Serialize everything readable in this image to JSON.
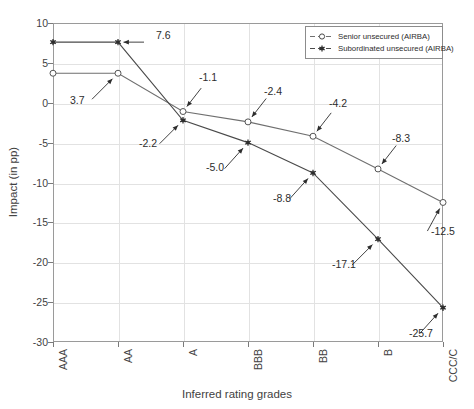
{
  "chart_data": {
    "type": "line",
    "title": "",
    "xlabel": "Inferred rating grades",
    "ylabel": "Impact (in pp)",
    "categories": [
      "AAA",
      "AA",
      "A",
      "BBB",
      "BB",
      "B",
      "CCC/C"
    ],
    "ylim": [
      -30,
      10
    ],
    "yticks": [
      10,
      5,
      0,
      -5,
      -10,
      -15,
      -20,
      -25,
      -30
    ],
    "ytick_labels": [
      "10",
      "5",
      "0",
      "-5",
      "-10",
      "-15",
      "-20",
      "-25",
      "-30"
    ],
    "grid": true,
    "legend_position": "top-right",
    "series": [
      {
        "name": "Senior unsecured (AIRBA)",
        "marker": "open-circle",
        "color": "#6f6f6f",
        "values": [
          3.7,
          3.7,
          -1.1,
          -2.4,
          -4.2,
          -8.3,
          -12.5
        ],
        "labels": [
          "3.7",
          "3.7",
          "-1.1",
          "-2.4",
          "-4.2",
          "-8.3",
          "-12.5"
        ]
      },
      {
        "name": "Subordinated unsecured (AIRBA)",
        "marker": "filled-star",
        "color": "#4a4a4a",
        "values": [
          7.6,
          7.6,
          -2.2,
          -5.0,
          -8.8,
          -17.1,
          -25.7
        ],
        "labels": [
          "7.6",
          "7.6",
          "-2.2",
          "-5.0",
          "-8.8",
          "-17.1",
          "-25.7"
        ]
      }
    ],
    "annotations": [
      {
        "text": "7.6",
        "series": "Subordinated unsecured (AIRBA)",
        "category": "AA",
        "value": 7.6
      },
      {
        "text": "3.7",
        "series": "Senior unsecured (AIRBA)",
        "category": "AA",
        "value": 3.7
      },
      {
        "text": "-1.1",
        "series": "Senior unsecured (AIRBA)",
        "category": "A",
        "value": -1.1
      },
      {
        "text": "-2.2",
        "series": "Subordinated unsecured (AIRBA)",
        "category": "A",
        "value": -2.2
      },
      {
        "text": "-2.4",
        "series": "Senior unsecured (AIRBA)",
        "category": "BBB",
        "value": -2.4
      },
      {
        "text": "-5.0",
        "series": "Subordinated unsecured (AIRBA)",
        "category": "BBB",
        "value": -5.0
      },
      {
        "text": "-4.2",
        "series": "Senior unsecured (AIRBA)",
        "category": "BB",
        "value": -4.2
      },
      {
        "text": "-8.8",
        "series": "Subordinated unsecured (AIRBA)",
        "category": "BB",
        "value": -8.8
      },
      {
        "text": "-8.3",
        "series": "Senior unsecured (AIRBA)",
        "category": "B",
        "value": -8.3
      },
      {
        "text": "-17.1",
        "series": "Subordinated unsecured (AIRBA)",
        "category": "B",
        "value": -17.1
      },
      {
        "text": "-12.5",
        "series": "Senior unsecured (AIRBA)",
        "category": "CCC/C",
        "value": -12.5
      },
      {
        "text": "-25.7",
        "series": "Subordinated unsecured (AIRBA)",
        "category": "CCC/C",
        "value": -25.7
      }
    ]
  },
  "legend": {
    "entries": [
      {
        "label": "Senior unsecured (AIRBA)"
      },
      {
        "label": "Subordinated unsecured (AIRBA)"
      }
    ]
  }
}
